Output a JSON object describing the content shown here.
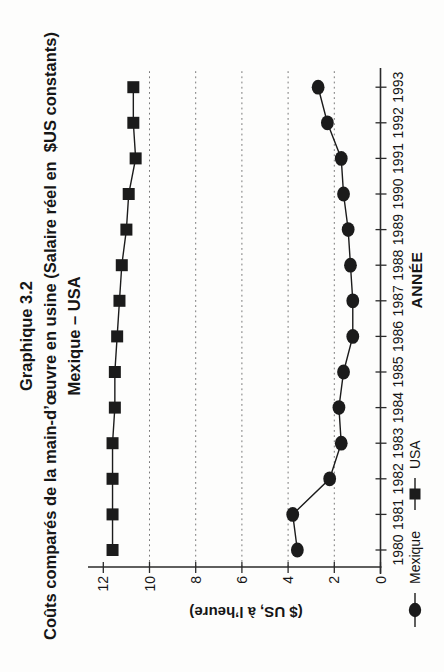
{
  "title": {
    "line1": "Graphique 3.2",
    "line2": "Coûts comparés de la main-d’œuvre en usine (Salaire réel en  $US constants)",
    "line3": "Mexique – USA"
  },
  "chart_data": {
    "type": "line",
    "orientation_note": "landscape chart printed rotated 90° counter-clockwise on portrait page",
    "x": [
      1980,
      1981,
      1982,
      1983,
      1984,
      1985,
      1986,
      1987,
      1988,
      1989,
      1990,
      1991,
      1992,
      1993
    ],
    "xtick_labels": [
      "1980",
      "1981",
      "1982",
      "1983",
      "1984",
      "1985",
      "1986",
      "1987",
      "1988",
      "1989",
      "1990",
      "1991",
      "1992",
      "1993"
    ],
    "series": [
      {
        "name": "Mexique",
        "marker": "circle",
        "values": [
          3.6,
          3.8,
          2.2,
          1.7,
          1.8,
          1.6,
          1.2,
          1.2,
          1.3,
          1.4,
          1.6,
          1.7,
          2.3,
          2.7
        ]
      },
      {
        "name": "USA",
        "marker": "square",
        "values": [
          11.6,
          11.6,
          11.6,
          11.6,
          11.5,
          11.5,
          11.4,
          11.3,
          11.2,
          11.0,
          10.9,
          10.6,
          10.7,
          10.7
        ]
      }
    ],
    "xlabel": "ANNÉE",
    "ylabel": "($ US, à l’heure)",
    "ylim": [
      0,
      12
    ],
    "ytick_step": 2,
    "ytick_labels": [
      "0",
      "2",
      "4",
      "6",
      "8",
      "10",
      "12"
    ],
    "gridline_values": [
      2,
      4,
      6,
      8,
      10
    ],
    "grid_style": "horizontal dashed",
    "legend_position": "bottom-left",
    "series_color": "#1b1b1b"
  },
  "colors": {
    "paper": "#fdfdfc",
    "ink": "#161616",
    "axis": "#2a2a2a",
    "grid": "#7a7a7a"
  }
}
